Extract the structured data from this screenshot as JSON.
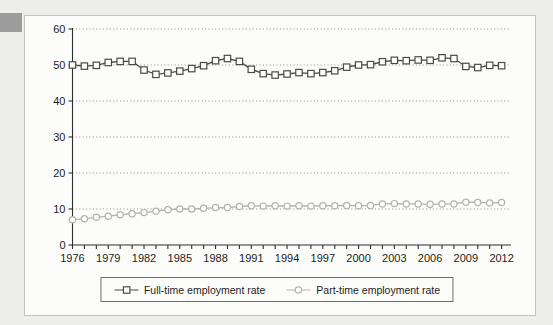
{
  "colors": {
    "page_bg": "#edeeea",
    "chart_bg": "#fcfcfa",
    "box_border": "#c2c2be",
    "legend_border": "#6e6e6e",
    "axis": "#2e2e2e",
    "grid": "#8a8a8a",
    "text": "#1c1c1c",
    "tab": "#9c9c9c",
    "full_time_series": "#4a4a4a",
    "part_time_series": "#b2b2b2"
  },
  "chart_data": {
    "type": "line",
    "title": "",
    "xlabel": "",
    "ylabel": "",
    "ylim": [
      0,
      60
    ],
    "yticks": [
      0,
      10,
      20,
      30,
      40,
      50,
      60
    ],
    "grid": "horizontal-dotted",
    "legend_position": "bottom",
    "x": [
      1976,
      1977,
      1978,
      1979,
      1980,
      1981,
      1982,
      1983,
      1984,
      1985,
      1986,
      1987,
      1988,
      1989,
      1990,
      1991,
      1992,
      1993,
      1994,
      1995,
      1996,
      1997,
      1998,
      1999,
      2000,
      2001,
      2002,
      2003,
      2004,
      2005,
      2006,
      2007,
      2008,
      2009,
      2010,
      2011,
      2012
    ],
    "x_tick_labels": [
      "1976",
      "1979",
      "1982",
      "1985",
      "1988",
      "1991",
      "1994",
      "1997",
      "2000",
      "2003",
      "2006",
      "2009",
      "2012"
    ],
    "series": [
      {
        "name": "Full-time employment rate",
        "marker": "square",
        "color": "#4a4a4a",
        "values": [
          50.0,
          49.7,
          49.9,
          50.7,
          51.0,
          51.0,
          48.6,
          47.4,
          47.8,
          48.3,
          49.0,
          49.8,
          51.2,
          51.8,
          51.0,
          48.8,
          47.6,
          47.2,
          47.5,
          47.9,
          47.6,
          47.9,
          48.4,
          49.4,
          50.0,
          50.1,
          50.9,
          51.3,
          51.2,
          51.4,
          51.3,
          52.0,
          51.8,
          49.6,
          49.3,
          49.9,
          49.8
        ]
      },
      {
        "name": "Part-time employment rate",
        "marker": "circle",
        "color": "#b2b2b2",
        "values": [
          7.0,
          7.3,
          7.7,
          8.0,
          8.4,
          8.7,
          9.0,
          9.4,
          9.8,
          10.0,
          10.0,
          10.2,
          10.4,
          10.4,
          10.7,
          10.9,
          10.8,
          10.9,
          10.8,
          10.9,
          10.8,
          10.9,
          10.9,
          11.0,
          10.9,
          11.0,
          11.4,
          11.5,
          11.4,
          11.4,
          11.3,
          11.4,
          11.4,
          11.9,
          11.8,
          11.7,
          11.8
        ]
      }
    ]
  }
}
